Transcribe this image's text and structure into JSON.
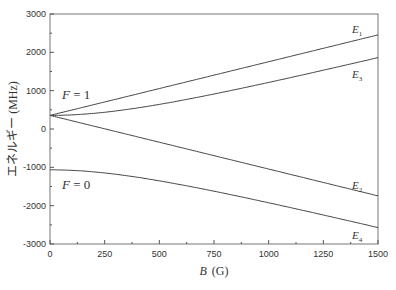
{
  "chart_data": {
    "type": "line",
    "title": "",
    "xlabel": "B (G)",
    "xlabel_var": "B",
    "xlabel_unit": "(G)",
    "ylabel": "エネルギー (MHz)",
    "xlim": [
      0,
      1500
    ],
    "ylim": [
      -3000,
      3000
    ],
    "xticks": [
      0,
      250,
      500,
      750,
      1000,
      1250,
      1500
    ],
    "yticks": [
      -3000,
      -2000,
      -1000,
      0,
      1000,
      2000,
      3000
    ],
    "grid": false,
    "x": [
      0,
      125,
      250,
      375,
      500,
      625,
      750,
      875,
      1000,
      1125,
      1250,
      1375,
      1500
    ],
    "series": [
      {
        "name": "E1",
        "label_main": "E",
        "label_sub": "1",
        "values": [
          355,
          530,
          705,
          880,
          1055,
          1230,
          1405,
          1580,
          1755,
          1930,
          2105,
          2280,
          2455
        ]
      },
      {
        "name": "E3",
        "label_main": "E",
        "label_sub": "3",
        "values": [
          355,
          376,
          436,
          524,
          632,
          752,
          881,
          1016,
          1155,
          1297,
          1442,
          1588,
          1862
        ]
      },
      {
        "name": "E2",
        "label_main": "E",
        "label_sub": "2",
        "values": [
          355,
          180,
          5,
          -170,
          -345,
          -520,
          -695,
          -870,
          -1045,
          -1220,
          -1395,
          -1570,
          -1745
        ]
      },
      {
        "name": "E4",
        "label_main": "E",
        "label_sub": "4",
        "values": [
          -1065,
          -1086,
          -1146,
          -1234,
          -1342,
          -1462,
          -1591,
          -1726,
          -1865,
          -2007,
          -2152,
          -2298,
          -2572
        ]
      }
    ],
    "annotations": [
      {
        "text": "F = 1",
        "x": 100,
        "y": 1000
      },
      {
        "text": "F = 0",
        "x": 100,
        "y": -1450
      }
    ]
  }
}
